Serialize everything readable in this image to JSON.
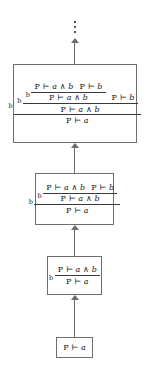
{
  "figure": {
    "top_ellipsis": "⋮",
    "rule_label": "b",
    "turnstile": "⊢",
    "conjunction": "∧",
    "arrow_glyph": "↑",
    "colors": {
      "background": "#ffffff",
      "box_border": "#6e6e6e",
      "arrow": "#6b6b6b",
      "rule_bar": "#3a3a3a",
      "text": "#1a1a1a"
    }
  },
  "sequents": {
    "p_turnstile_a": "P ⊢ a",
    "p_turnstile_b": "P ⊢ b",
    "p_turnstile_a_and_b": "P ⊢ a ∧ b"
  },
  "nodes": [
    {
      "id": "box-4-leaf",
      "order": 1,
      "label": "leaf",
      "depth": 0,
      "content": "P ⊢ a"
    },
    {
      "id": "box-3",
      "order": 2,
      "label": "one-step derivation",
      "depth": 1,
      "rule": "b",
      "premise": "P ⊢ a ∧ b",
      "conclusion": "P ⊢ a"
    },
    {
      "id": "box-2",
      "order": 3,
      "label": "two-step derivation",
      "depth": 2,
      "rule": "b",
      "premises": [
        "P ⊢ a ∧ b",
        "P ⊢ b"
      ],
      "intermediate": "P ⊢ a ∧ b",
      "conclusion": "P ⊢ a"
    },
    {
      "id": "box-1",
      "order": 4,
      "label": "three-step derivation",
      "depth": 3,
      "rule": "b",
      "premises": [
        "P ⊢ a ∧ b",
        "P ⊢ b"
      ],
      "extra_premise": "P ⊢ b",
      "intermediate_1": "P ⊢ a ∧ b",
      "intermediate_2": "P ⊢ a ∧ b",
      "conclusion": "P ⊢ a"
    }
  ],
  "arrows": [
    {
      "id": "arrow-leaf-to-box3",
      "from": "box-4-leaf",
      "to": "box-3"
    },
    {
      "id": "arrow-box3-to-box2",
      "from": "box-3",
      "to": "box-2"
    },
    {
      "id": "arrow-box2-to-box1",
      "from": "box-2",
      "to": "box-1"
    },
    {
      "id": "arrow-box1-to-ellipsis",
      "from": "box-1",
      "to": "ellipsis"
    }
  ]
}
